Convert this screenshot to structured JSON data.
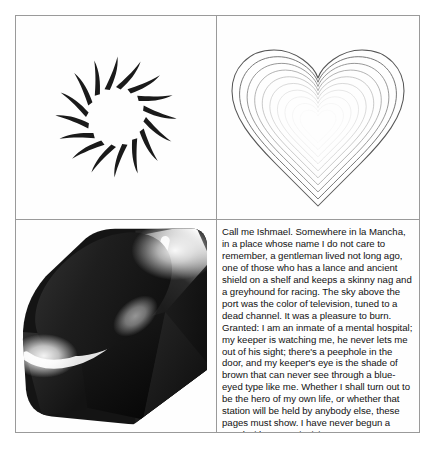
{
  "figure": {
    "layout": "2x2-grid",
    "border_color": "#9a9a9a",
    "background_color": "#fefefe",
    "panels": [
      {
        "position": "top-left",
        "name": "spiral-sun-figure",
        "type": "vector-graphic",
        "description": "pinwheel sun made of 16 curved tapered black rays radiating from an empty center",
        "ray_count": 16,
        "stroke_color": "#1a1a1a"
      },
      {
        "position": "top-right",
        "name": "concentric-hearts-figure",
        "type": "vector-graphic",
        "description": "10 nested heart outlines fading from dark gray at the outside to near white at the center",
        "contour_count": 10,
        "outer_stroke_color": "#555555",
        "inner_stroke_color": "#e8e8e8"
      },
      {
        "position": "bottom-left",
        "name": "ruby-gem-figure",
        "type": "raster-graphic",
        "description": "faceted cut gemstone (Ruby logo) rendered in grayscale with bright specular highlights",
        "dark_color": "#161616",
        "highlight_color": "#ffffff"
      },
      {
        "position": "bottom-right",
        "name": "text-passage-panel",
        "type": "text"
      }
    ]
  },
  "text_panel": {
    "body": "Call me Ishmael. Somewhere in la Mancha, in a place whose name I do not care to remember, a gentleman lived not long ago, one of those who has a lance and ancient shield on a shelf and keeps a skinny nag and a greyhound for racing. The sky above the port was the color of television, tuned to a dead channel. It was a pleasure to burn. Granted: I am an inmate of a mental hospital; my keeper is watching me, he never lets me out of his sight; there's a peephole in the door, and my keeper's eye is the shade of brown that can never see through a blue-eyed type like me. Whether I shall turn out to be the hero of my own life, or whether that station will be held by anybody else, these pages must show. I have never begun a novel with more misgiving.",
    "font_size_px": 9.6,
    "line_count": 16,
    "text_color": "#111111"
  }
}
